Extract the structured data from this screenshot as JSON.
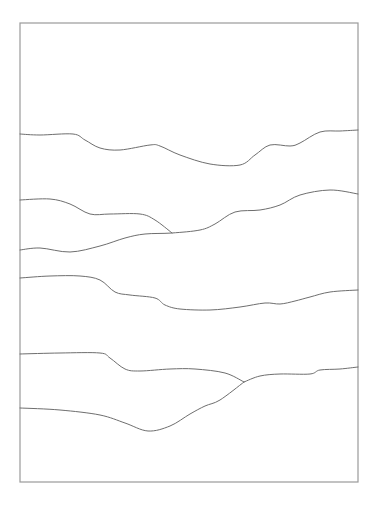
{
  "canvas": {
    "width": 379,
    "height": 506,
    "background": "#ffffff"
  },
  "frame": {
    "x": 20,
    "y": 23,
    "width": 338,
    "height": 459,
    "stroke": "#9a9a9a"
  },
  "line_color": "#6e6e6e",
  "curves": [
    {
      "name": "curve-1",
      "points": [
        [
          20,
          134
        ],
        [
          40,
          135
        ],
        [
          73,
          134
        ],
        [
          85,
          140
        ],
        [
          100,
          148
        ],
        [
          120,
          150
        ],
        [
          150,
          145
        ],
        [
          160,
          146
        ],
        [
          180,
          155
        ],
        [
          210,
          164
        ],
        [
          240,
          165
        ],
        [
          255,
          155
        ],
        [
          270,
          145
        ],
        [
          290,
          146
        ],
        [
          300,
          143
        ],
        [
          320,
          132
        ],
        [
          340,
          131
        ],
        [
          358,
          130
        ]
      ]
    },
    {
      "name": "curve-2",
      "points": [
        [
          20,
          200
        ],
        [
          50,
          199
        ],
        [
          70,
          204
        ],
        [
          90,
          214
        ],
        [
          110,
          214
        ],
        [
          140,
          214
        ],
        [
          155,
          220
        ],
        [
          172,
          233
        ]
      ]
    },
    {
      "name": "curve-3",
      "points": [
        [
          20,
          250
        ],
        [
          40,
          248
        ],
        [
          70,
          252
        ],
        [
          100,
          246
        ],
        [
          125,
          238
        ],
        [
          145,
          234
        ],
        [
          172,
          233
        ],
        [
          200,
          230
        ],
        [
          215,
          224
        ],
        [
          235,
          212
        ],
        [
          260,
          210
        ],
        [
          280,
          205
        ],
        [
          300,
          195
        ],
        [
          330,
          190
        ],
        [
          358,
          194
        ]
      ]
    },
    {
      "name": "curve-4",
      "points": [
        [
          20,
          278
        ],
        [
          50,
          276
        ],
        [
          80,
          276
        ],
        [
          100,
          280
        ],
        [
          115,
          292
        ],
        [
          130,
          295
        ],
        [
          155,
          298
        ],
        [
          165,
          305
        ],
        [
          180,
          309
        ],
        [
          210,
          310
        ],
        [
          240,
          307
        ],
        [
          265,
          303
        ],
        [
          280,
          304
        ],
        [
          295,
          301
        ],
        [
          310,
          297
        ],
        [
          330,
          292
        ],
        [
          358,
          290
        ]
      ]
    },
    {
      "name": "curve-5",
      "points": [
        [
          20,
          354
        ],
        [
          60,
          353
        ],
        [
          100,
          353
        ],
        [
          110,
          358
        ],
        [
          125,
          369
        ],
        [
          140,
          371
        ],
        [
          170,
          369
        ],
        [
          195,
          369
        ],
        [
          225,
          373
        ],
        [
          244,
          382
        ]
      ]
    },
    {
      "name": "curve-6",
      "points": [
        [
          244,
          382
        ],
        [
          260,
          376
        ],
        [
          280,
          374
        ],
        [
          310,
          374
        ],
        [
          320,
          370
        ],
        [
          340,
          369
        ],
        [
          358,
          367
        ]
      ]
    },
    {
      "name": "curve-7",
      "points": [
        [
          20,
          408
        ],
        [
          60,
          410
        ],
        [
          100,
          415
        ],
        [
          125,
          423
        ],
        [
          148,
          431
        ],
        [
          170,
          426
        ],
        [
          190,
          414
        ],
        [
          205,
          406
        ],
        [
          220,
          400
        ],
        [
          244,
          382
        ]
      ]
    }
  ]
}
